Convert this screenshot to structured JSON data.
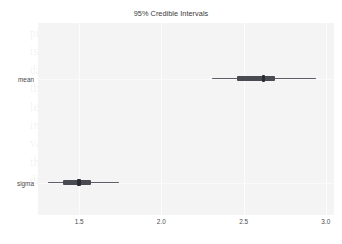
{
  "chart_data": {
    "type": "bar",
    "title": "95% Credible Intervals",
    "xlabel": "",
    "ylabel": "",
    "xlim": [
      1.25,
      3.05
    ],
    "ylim": [
      0,
      2
    ],
    "grid": true,
    "legend": null,
    "orientation": "horizontal",
    "categories": [
      "mean",
      "sigma"
    ],
    "xticks": [
      "1.5",
      "2.0",
      "2.5",
      "3.0"
    ],
    "xtick_values": [
      1.5,
      2.0,
      2.5,
      3.0
    ],
    "series": [
      {
        "name": "95% credible interval",
        "values": [
          2.62,
          1.5
        ]
      },
      {
        "name": "outer interval (94% HDI)",
        "lower": [
          2.31,
          1.31
        ],
        "upper": [
          2.94,
          1.74
        ]
      },
      {
        "name": "inner interval (50% HDI)",
        "lower": [
          2.46,
          1.4
        ],
        "upper": [
          2.69,
          1.57
        ]
      }
    ],
    "points": [
      {
        "label": "mean",
        "estimate": 2.62,
        "inner_low": 2.46,
        "inner_high": 2.69,
        "outer_low": 2.31,
        "outer_high": 2.94
      },
      {
        "label": "sigma",
        "estimate": 1.5,
        "inner_low": 1.4,
        "inner_high": 1.57,
        "outer_low": 1.31,
        "outer_high": 1.74
      }
    ],
    "colors": {
      "panel_background": "#f4f4f4",
      "figure_background": "#ffffff",
      "interval_line": "#5e5e66",
      "interval_thick": "#4a4a52",
      "point_marker": "#2a2a30",
      "gridline": "#ffffff",
      "tick_label": "#4a4a4a",
      "title": "#3a3a3a"
    }
  },
  "bleed_text": {
    "lines": [
      "problem",
      "is for a different data, no information of",
      "data for a sample with the physical parameter",
      "that we acquired from the observed data, and",
      "learn the posterior and one of the central",
      "into two parts of. The posterior distribution over",
      "variable which confidence from Bayes infer",
      "that is a model is to which we are calculating the",
      "data on the case from; inference for Bayesian to a"
    ]
  }
}
